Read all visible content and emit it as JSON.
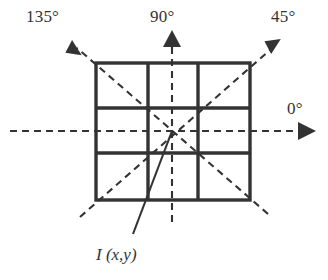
{
  "figure": {
    "background_color": "#ffffff",
    "stroke_color": "#333333",
    "grid": {
      "rows": 3,
      "cols": 3,
      "left": 96,
      "top": 63,
      "right": 250,
      "bottom": 200,
      "v_lines": [
        148,
        198
      ],
      "h_lines": [
        108,
        153
      ],
      "border_width": 3.2,
      "inner_width": 3.2
    },
    "center": {
      "x": 172,
      "y": 131
    },
    "axes": [
      {
        "name": "axis-0",
        "label": "0°",
        "angle_deg": 0,
        "from": {
          "x": 10,
          "y": 131
        },
        "to": {
          "x": 300,
          "y": 131
        },
        "arrow_at": {
          "x": 313,
          "y": 131
        },
        "arrow_rotation": 0,
        "dashed": true
      },
      {
        "name": "axis-45",
        "label": "45°",
        "angle_deg": 45,
        "from": {
          "x": 80,
          "y": 216
        },
        "to": {
          "x": 269,
          "y": 50
        },
        "arrow_at": {
          "x": 277,
          "y": 43
        },
        "arrow_rotation": -41,
        "dashed": true
      },
      {
        "name": "axis-90",
        "label": "90°",
        "angle_deg": 90,
        "from": {
          "x": 172,
          "y": 222
        },
        "to": {
          "x": 172,
          "y": 44
        },
        "arrow_at": {
          "x": 172,
          "y": 33
        },
        "arrow_rotation": -90,
        "dashed": true
      },
      {
        "name": "axis-135",
        "label": "135°",
        "angle_deg": 135,
        "from": {
          "x": 268,
          "y": 213
        },
        "to": {
          "x": 76,
          "y": 48
        },
        "arrow_at": {
          "x": 68,
          "y": 41
        },
        "arrow_rotation": -139,
        "dashed": true
      }
    ],
    "leader": {
      "name": "pixel-leader-line",
      "from": {
        "x": 172,
        "y": 131
      },
      "to": {
        "x": 133,
        "y": 234
      },
      "dashed": false
    },
    "labels": {
      "deg_135": "135°",
      "deg_90": "90°",
      "deg_45": "45°",
      "deg_0": "0°",
      "pixel": "I (x,y)",
      "pixel_symbol": "I",
      "pixel_args": "(x,y)"
    }
  }
}
